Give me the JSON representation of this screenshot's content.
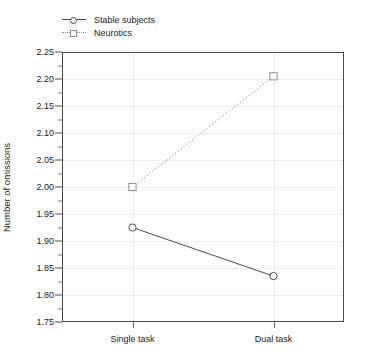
{
  "chart_data": {
    "type": "line",
    "title": "",
    "xlabel": "",
    "ylabel": "Number of omissions",
    "categories": [
      "Single task",
      "Dual task"
    ],
    "ylim": [
      1.75,
      2.25
    ],
    "ytick_step": 0.05,
    "ytick_labels": [
      "2.25",
      "2.20",
      "2.15",
      "2.10",
      "2.05",
      "2.00",
      "1.95",
      "1.90",
      "1.85",
      "1.80",
      "1.75"
    ],
    "ytick_values": [
      2.25,
      2.2,
      2.15,
      2.1,
      2.05,
      2.0,
      1.95,
      1.9,
      1.85,
      1.8,
      1.75
    ],
    "grid": "both-light",
    "legend_position": "top-left-outside",
    "series": [
      {
        "name": "Stable subjects",
        "values": [
          1.925,
          1.835
        ],
        "marker": "circle",
        "line_style": "solid",
        "color": "#4d4d4d"
      },
      {
        "name": "Neurotics",
        "values": [
          2.0,
          2.205
        ],
        "marker": "square",
        "line_style": "dotted",
        "color": "#8c8c8c"
      }
    ]
  },
  "legend": {
    "items": [
      {
        "label": "Stable subjects",
        "marker": "circle-marker",
        "style": "solid"
      },
      {
        "label": "Neurotics",
        "marker": "square-marker",
        "style": "dotted"
      }
    ]
  },
  "axes": {
    "y_title": "Number of omissions",
    "x_categories": [
      "Single task",
      "Dual task"
    ]
  }
}
